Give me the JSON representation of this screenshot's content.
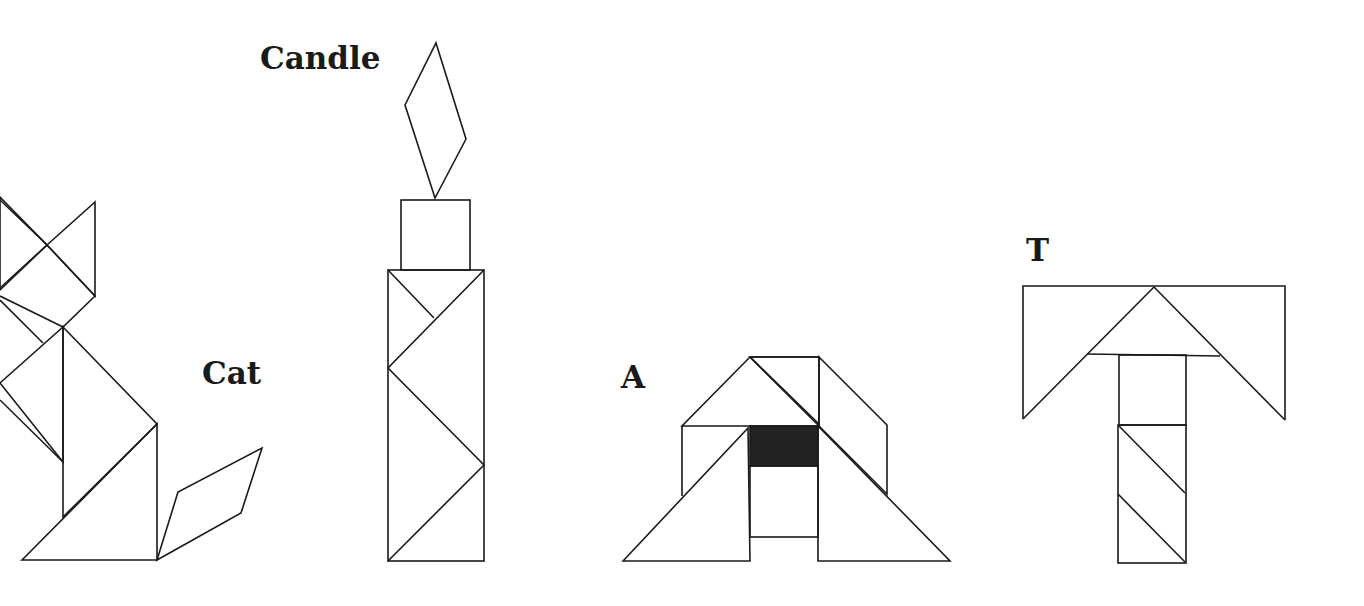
{
  "figure": {
    "type": "tangram-puzzle-figures",
    "background_color": "#ffffff",
    "line_color": "#1a1a1a",
    "fill_color": "#222222"
  },
  "figures": [
    {
      "name": "cat",
      "label": "Cat"
    },
    {
      "name": "candle",
      "label": "Candle"
    },
    {
      "name": "letter-a",
      "label": "A"
    },
    {
      "name": "letter-t",
      "label": "T"
    }
  ]
}
